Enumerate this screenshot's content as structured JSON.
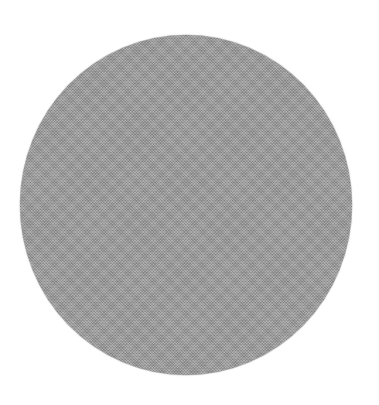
{
  "canvas": {
    "width": 379,
    "height": 405,
    "background_color": "#ffffff"
  },
  "shape": {
    "type": "circle",
    "fill_color": "#9b9b9b",
    "texture": "fine-noise",
    "center": [
      186,
      205
    ],
    "width": 332,
    "height": 340
  }
}
